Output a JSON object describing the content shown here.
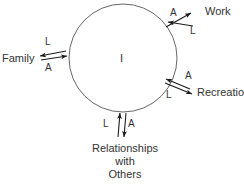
{
  "diagram": {
    "type": "system-exchange-circle",
    "center_node": {
      "label": "I",
      "name": "self-node"
    },
    "circle": {
      "cx": 123,
      "cy": 58,
      "r": 54,
      "stroke": "#555555",
      "stroke_width": 0.8,
      "fill": "none"
    },
    "exchange_symbols": {
      "love": "L",
      "anger": "A"
    },
    "nodes": [
      {
        "id": "family",
        "label": "Family",
        "position": "left",
        "arrow_orientation": "horizontal",
        "inbound_label": "L",
        "outbound_label": "A"
      },
      {
        "id": "work",
        "label": "Work",
        "position": "upper-right",
        "arrow_orientation": "diagonal-up",
        "inbound_label": "A",
        "outbound_label": "L"
      },
      {
        "id": "recreation",
        "label": "Recreatior",
        "position": "lower-right",
        "arrow_orientation": "diagonal-down",
        "inbound_label": "A",
        "outbound_label": "L"
      },
      {
        "id": "relationships",
        "label_lines": [
          "Relationships",
          "with",
          "Others"
        ],
        "position": "bottom",
        "arrow_orientation": "vertical",
        "inbound_label": "L",
        "outbound_label": "A"
      }
    ],
    "colors": {
      "stroke": "#555555",
      "arrow": "#1a1a1a",
      "text": "#333333",
      "background": "#ffffff"
    }
  }
}
